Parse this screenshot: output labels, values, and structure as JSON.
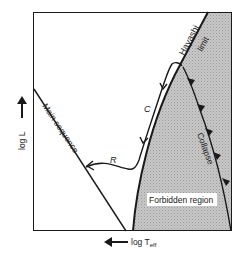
{
  "diagram": {
    "type": "Hertzsprung-Russell diagram (pre-main-sequence evolution)",
    "axes": {
      "x_label": "log T",
      "x_label_subscript": "eff",
      "x_arrow_direction": "left",
      "y_label": "log L",
      "y_arrow_direction": "up"
    },
    "labels": {
      "hayashi": "Hayashi",
      "limit": "limit",
      "main_sequence": "Main sequence",
      "collapse": "Collapse",
      "forbidden_region": "Forbidden region",
      "c_track": "C",
      "r_track": "R"
    },
    "colors": {
      "line": "#1a1a1a",
      "forbidden_fill": "#bdbdbd",
      "background": "#ffffff"
    }
  }
}
